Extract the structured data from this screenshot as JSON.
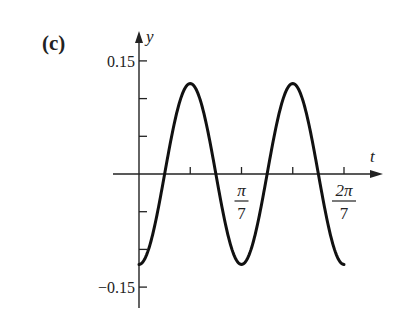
{
  "panel_label": "(c)",
  "chart_data": {
    "type": "line",
    "title": "",
    "xlabel": "t",
    "ylabel": "y",
    "function": "y = -0.12 cos(14 t)",
    "x_ticks": [
      {
        "value": 0.2244,
        "label": ""
      },
      {
        "value": 0.4488,
        "label_num": "π",
        "label_den": "7"
      },
      {
        "value": 0.6732,
        "label": ""
      },
      {
        "value": 0.8976,
        "label_num": "2π",
        "label_den": "7"
      }
    ],
    "y_ticks": [
      {
        "value": 0.15,
        "label": "0.15"
      },
      {
        "value": 0.1,
        "label": ""
      },
      {
        "value": 0.05,
        "label": ""
      },
      {
        "value": -0.05,
        "label": ""
      },
      {
        "value": -0.1,
        "label": ""
      },
      {
        "value": -0.15,
        "label": "−0.15"
      }
    ],
    "xlim": [
      0,
      0.8976
    ],
    "ylim": [
      -0.15,
      0.15
    ],
    "series": [
      {
        "name": "y(t)",
        "x": [
          0,
          0.1122,
          0.2244,
          0.3366,
          0.4488,
          0.561,
          0.6732,
          0.7854,
          0.8976
        ],
        "values": [
          -0.12,
          0.0,
          0.12,
          0.0,
          -0.12,
          0.0,
          0.12,
          0.0,
          -0.12
        ]
      }
    ],
    "grid": false,
    "legend": null
  }
}
